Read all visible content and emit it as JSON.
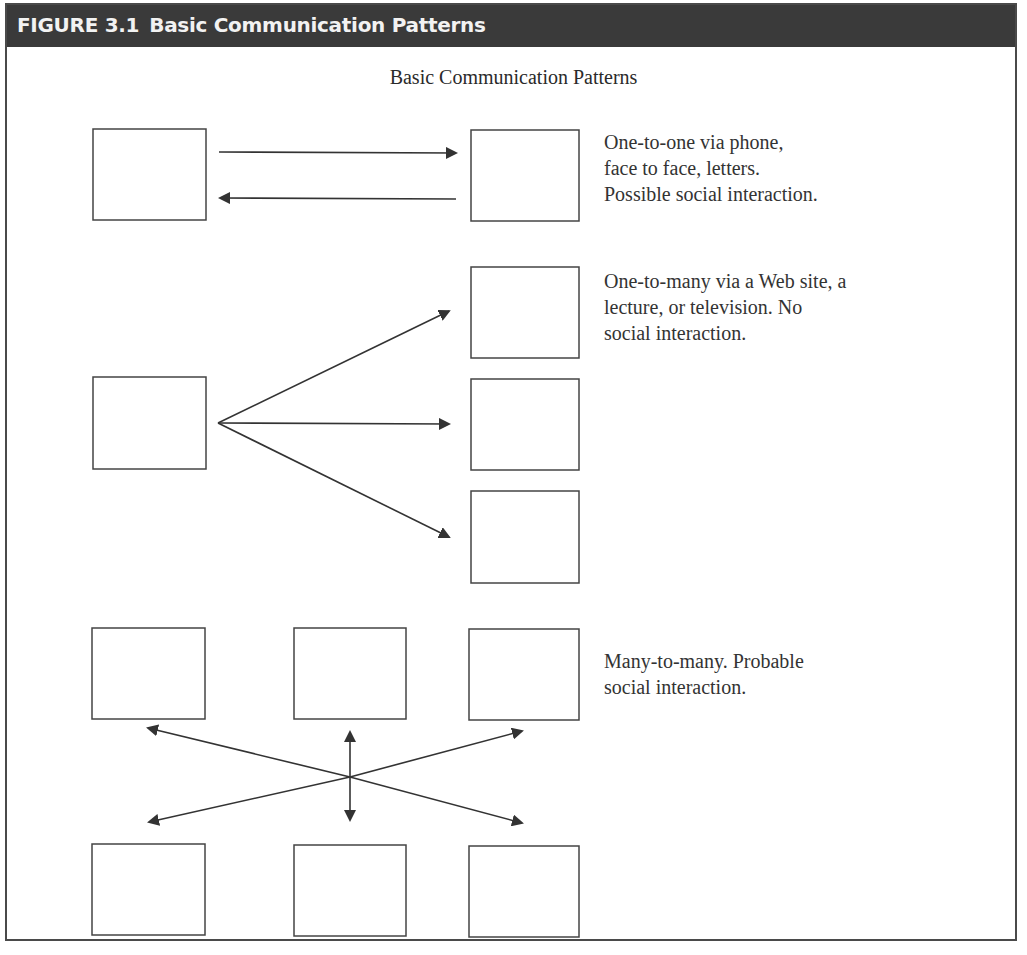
{
  "figure": {
    "number": "FIGURE 3.1",
    "title": "Basic Communication Patterns"
  },
  "diagram": {
    "subtitle": "Basic Communication Patterns",
    "patterns": [
      {
        "id": "one-to-one",
        "description_lines": [
          "One-to-one via phone,",
          "face to face, letters.",
          "Possible social interaction."
        ]
      },
      {
        "id": "one-to-many",
        "description_lines": [
          "One-to-many via a Web site, a",
          "lecture, or television. No",
          "social interaction."
        ]
      },
      {
        "id": "many-to-many",
        "description_lines": [
          "Many-to-many. Probable",
          "social interaction."
        ]
      }
    ]
  },
  "colors": {
    "header_bg": "#3a3a3a",
    "header_text": "#f2f2f2",
    "line": "#333333",
    "text": "#333333"
  }
}
